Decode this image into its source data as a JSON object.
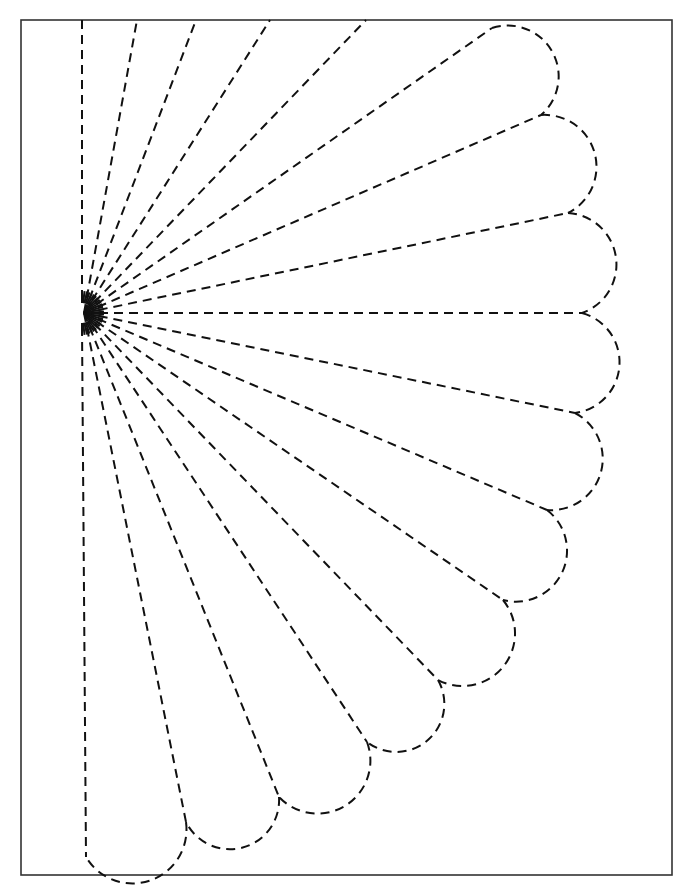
{
  "diagram": {
    "type": "quilt-pattern-template",
    "frame": {
      "x": 21,
      "y": 20,
      "width": 651,
      "height": 855,
      "stroke": "#333333"
    },
    "line_color": "#111111",
    "dash": "9 6",
    "center": {
      "x": 84,
      "y": 313
    },
    "inner_radius": 14,
    "open_rays_top": [
      {
        "x": 82,
        "y": 20
      },
      {
        "x": 137,
        "y": 20
      },
      {
        "x": 196,
        "y": 20
      },
      {
        "x": 270,
        "y": 20
      },
      {
        "x": 366,
        "y": 20
      }
    ],
    "scallop_points": [
      {
        "x": 492,
        "y": 28
      },
      {
        "x": 541,
        "y": 115
      },
      {
        "x": 568,
        "y": 213
      },
      {
        "x": 582,
        "y": 313
      },
      {
        "x": 575,
        "y": 413
      },
      {
        "x": 547,
        "y": 510
      },
      {
        "x": 503,
        "y": 600
      },
      {
        "x": 438,
        "y": 680
      },
      {
        "x": 367,
        "y": 742
      },
      {
        "x": 279,
        "y": 797
      },
      {
        "x": 186,
        "y": 822
      },
      {
        "x": 86,
        "y": 857
      }
    ],
    "blade_count": 11
  }
}
